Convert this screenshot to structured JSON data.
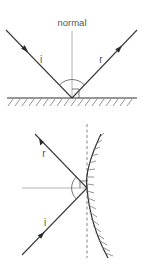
{
  "figure": {
    "colors": {
      "line": "#3a3a3a",
      "normal": "#9a9a9a",
      "hatch": "#7a7a7a",
      "text": "#555555",
      "background": "#ffffff"
    },
    "plane_mirror": {
      "normal_label": "normal",
      "incident_label": "i",
      "reflected_label": "r"
    },
    "curved_mirror": {
      "incident_label": "i",
      "reflected_label": "r"
    }
  }
}
